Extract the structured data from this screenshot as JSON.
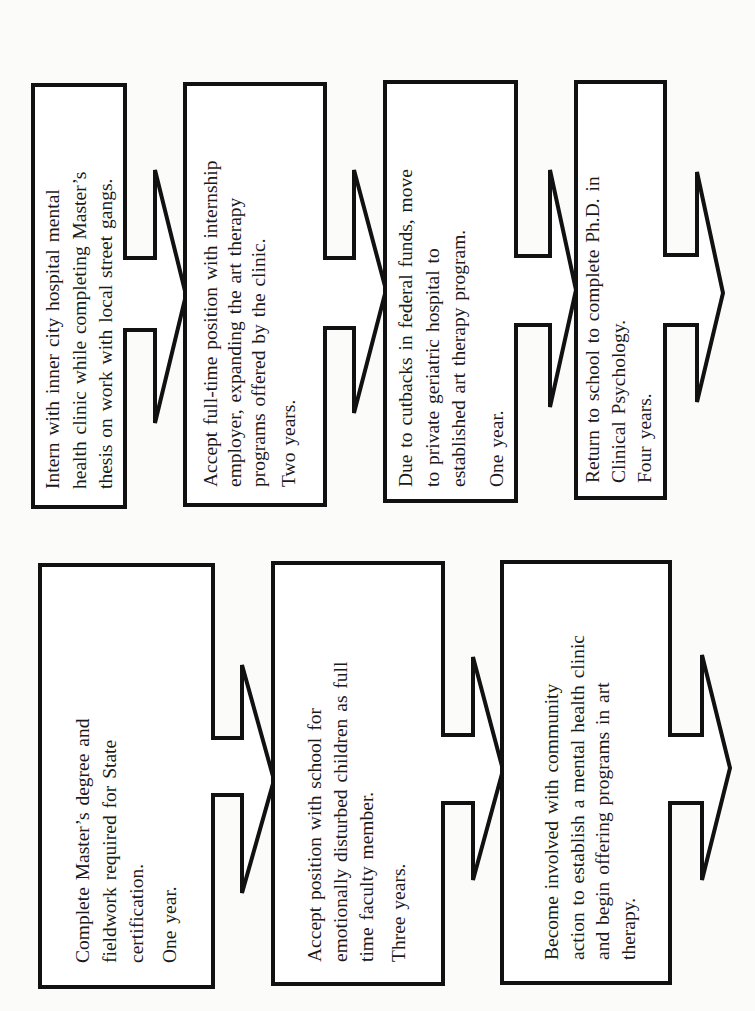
{
  "diagram": {
    "orientation": "rotated 90 degrees counter-clockwise",
    "rows": [
      {
        "name": "top-row",
        "steps": [
          {
            "lines": [
              "Intern with inner city hospital mental",
              "health clinic while completing Master’s",
              "thesis on work with local street gangs."
            ],
            "duration": ""
          },
          {
            "lines": [
              "Accept full-time position with internship",
              "employer, expanding the art therapy",
              "programs offered by the clinic."
            ],
            "duration": "Two years."
          },
          {
            "lines": [
              "Due to cutbacks in federal funds, move",
              "to private geriatric hospital to",
              "established art therapy program."
            ],
            "duration": "One year."
          },
          {
            "lines": [
              "Return to school to complete Ph.D. in",
              "Clinical Psychology."
            ],
            "duration": "Four years."
          }
        ]
      },
      {
        "name": "bottom-row",
        "steps": [
          {
            "lines": [
              "Complete Master’s degree and",
              "fieldwork required for State",
              "certification."
            ],
            "duration": "One year."
          },
          {
            "lines": [
              "Accept position with school for",
              "emotionally disturbed children as full",
              "time faculty member."
            ],
            "duration": "Three years."
          },
          {
            "lines": [
              "Become involved with community",
              "action to establish a mental health clinic",
              "and begin offering programs in art",
              "therapy."
            ],
            "duration": ""
          }
        ]
      }
    ],
    "colors": {
      "stroke": "#111111",
      "fill": "#ffffff",
      "background": "#fbfbfa",
      "text": "#1a1a1a"
    }
  }
}
